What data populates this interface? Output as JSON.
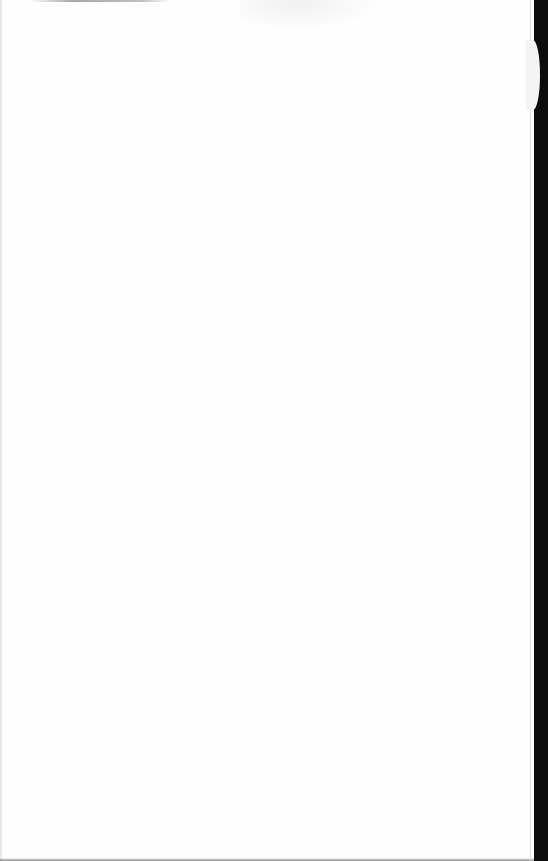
{
  "document": {
    "type": "scanned-page",
    "content": "",
    "colors": {
      "paper": "#fefefe",
      "background_strip": "#0c0c0c",
      "edge_shadow": "#6e6e6e"
    }
  }
}
